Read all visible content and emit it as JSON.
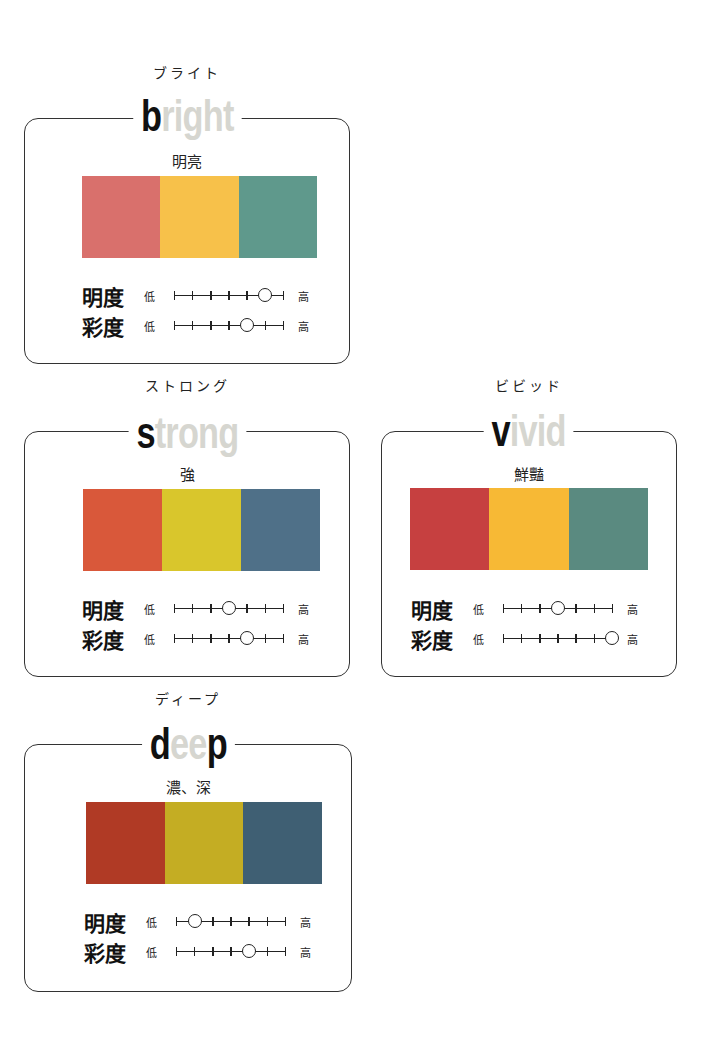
{
  "labels": {
    "brightness": "明度",
    "saturation": "彩度",
    "low": "低",
    "high": "高"
  },
  "scale": {
    "positions": 7
  },
  "cards": [
    {
      "id": "bright",
      "kana": "ブライト",
      "title_dark": "b",
      "title_light": "right",
      "title_tail_dark": "",
      "subtitle": "明亮",
      "colors": [
        "#d9706c",
        "#f7c14a",
        "#5f998c"
      ],
      "brightness_index": 5,
      "saturation_index": 4
    },
    {
      "id": "strong",
      "kana": "ストロング",
      "title_dark": "s",
      "title_light": "trong",
      "title_tail_dark": "",
      "subtitle": "強",
      "colors": [
        "#d9583a",
        "#d9c62c",
        "#4f7088"
      ],
      "brightness_index": 3,
      "saturation_index": 4
    },
    {
      "id": "vivid",
      "kana": "ビビッド",
      "title_dark": "v",
      "title_light": "ivid",
      "title_tail_dark": "",
      "subtitle": "鮮豔",
      "colors": [
        "#c64040",
        "#f7b935",
        "#5a8a80"
      ],
      "brightness_index": 3,
      "saturation_index": 6
    },
    {
      "id": "deep",
      "kana": "ディープ",
      "title_dark": "d",
      "title_light": "ee",
      "title_tail_dark": "p",
      "subtitle": "濃、深",
      "colors": [
        "#b03a25",
        "#c4ad23",
        "#3f5f73"
      ],
      "brightness_index": 1,
      "saturation_index": 4
    }
  ]
}
